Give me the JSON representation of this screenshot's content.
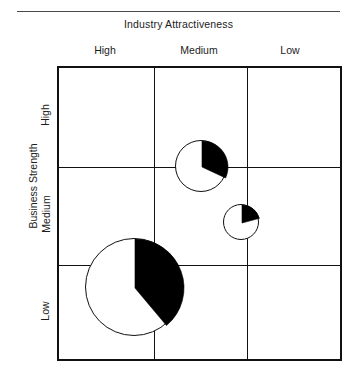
{
  "figure": {
    "title": "Industry Attractiveness",
    "y_axis_title": "Business Strength",
    "column_labels": [
      "High",
      "Medium",
      "Low"
    ],
    "row_labels": [
      "High",
      "Medium",
      "Low"
    ],
    "colors": {
      "grid_line": "#111111",
      "share_fill": "#000000",
      "remainder_fill": "#ffffff",
      "rule": "#4a4a4a",
      "text": "#1c1c1c"
    }
  },
  "chart_data": {
    "type": "pie",
    "title": "Industry Attractiveness",
    "xlabel": "Industry Attractiveness",
    "ylabel": "Business Strength",
    "grid": true,
    "legend": "none",
    "x_categories": [
      "High",
      "Medium",
      "Low"
    ],
    "y_categories": [
      "High",
      "Medium",
      "Low"
    ],
    "note": "GE/McKinsey nine-box matrix; circle area encodes market size, black wedge encodes company market share.",
    "bubbles": [
      {
        "id": "bubble-1",
        "industry_attractiveness": "Medium",
        "business_strength": "High",
        "center_x": 201,
        "center_y": 166,
        "radius": 26,
        "share_percent": 32,
        "share_start_angle_deg": 0,
        "share_end_angle_deg": 115
      },
      {
        "id": "bubble-2",
        "industry_attractiveness": "Medium",
        "business_strength": "Medium",
        "center_x": 241,
        "center_y": 222,
        "radius": 18,
        "share_percent": 21,
        "share_start_angle_deg": 0,
        "share_end_angle_deg": 75
      },
      {
        "id": "bubble-3",
        "industry_attractiveness": "High",
        "business_strength": "Low",
        "center_x": 134,
        "center_y": 287,
        "radius": 49,
        "share_percent": 39,
        "share_start_angle_deg": 0,
        "share_end_angle_deg": 140
      }
    ],
    "matrix": {
      "left": 57,
      "top": 66,
      "width": 285,
      "height": 295,
      "col_dividers_x": [
        152,
        245
      ],
      "row_dividers_y": [
        165,
        263
      ]
    }
  }
}
